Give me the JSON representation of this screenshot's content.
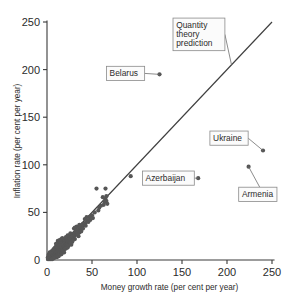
{
  "chart_data": {
    "type": "scatter",
    "title": "",
    "xlabel": "Money growth rate (per cent per year)",
    "ylabel": "Inflation rate (per cent per year)",
    "xlim": [
      0,
      250
    ],
    "ylim": [
      0,
      250
    ],
    "xticks": [
      0,
      50,
      100,
      150,
      200,
      250
    ],
    "yticks": [
      0,
      50,
      100,
      150,
      200,
      250
    ],
    "xtick_labels": [
      "0",
      "50",
      "100",
      "150",
      "200",
      "250"
    ],
    "ytick_labels": [
      "0",
      "50",
      "100",
      "150",
      "200",
      "250"
    ],
    "grid": false,
    "legend": false,
    "reference_line": {
      "name": "Quantity theory prediction",
      "type": "identity",
      "slope": 1,
      "intercept": 0,
      "from": [
        0,
        0
      ],
      "to": [
        250,
        250
      ]
    },
    "annotations": [
      {
        "label": "Belarus",
        "x": 125,
        "y": 195,
        "box_x": 66,
        "box_y": 196
      },
      {
        "label": "Ukraine",
        "x": 240,
        "y": 115,
        "box_x": 181,
        "box_y": 128
      },
      {
        "label": "Armenia",
        "x": 224,
        "y": 98,
        "box_x": 213,
        "box_y": 69
      },
      {
        "label": "Azerbaijan",
        "x": 168,
        "y": 86,
        "box_x": 106,
        "box_y": 86
      },
      {
        "label": "Quantity theory prediction",
        "x": 205,
        "y": 205,
        "box_x": 140,
        "box_y": 237
      }
    ],
    "points": [
      [
        125,
        195
      ],
      [
        240,
        115
      ],
      [
        224,
        98
      ],
      [
        168,
        86
      ],
      [
        93,
        88
      ],
      [
        55,
        75
      ],
      [
        65,
        75
      ],
      [
        65,
        64
      ],
      [
        66,
        62
      ],
      [
        64,
        61
      ],
      [
        67,
        59
      ],
      [
        63,
        58
      ],
      [
        58,
        55
      ],
      [
        53,
        50
      ],
      [
        50,
        47
      ],
      [
        47,
        45
      ],
      [
        45,
        41
      ],
      [
        43,
        39
      ],
      [
        41,
        37
      ],
      [
        40,
        38
      ],
      [
        38,
        34
      ],
      [
        37,
        32
      ],
      [
        36,
        33
      ],
      [
        35,
        30
      ],
      [
        34,
        31
      ],
      [
        33,
        28
      ],
      [
        32,
        27
      ],
      [
        32,
        30
      ],
      [
        31,
        26
      ],
      [
        30,
        25
      ],
      [
        30,
        28
      ],
      [
        29,
        24
      ],
      [
        29,
        27
      ],
      [
        28,
        23
      ],
      [
        28,
        26
      ],
      [
        27,
        22
      ],
      [
        27,
        25
      ],
      [
        26,
        21
      ],
      [
        26,
        24
      ],
      [
        25,
        20
      ],
      [
        25,
        23
      ],
      [
        24,
        19
      ],
      [
        24,
        22
      ],
      [
        23,
        18
      ],
      [
        23,
        21
      ],
      [
        22,
        17
      ],
      [
        22,
        20
      ],
      [
        21,
        16
      ],
      [
        21,
        19
      ],
      [
        20,
        15
      ],
      [
        20,
        18
      ],
      [
        20,
        21
      ],
      [
        19,
        14
      ],
      [
        19,
        17
      ],
      [
        19,
        20
      ],
      [
        18,
        13
      ],
      [
        18,
        16
      ],
      [
        18,
        19
      ],
      [
        17,
        12
      ],
      [
        17,
        15
      ],
      [
        17,
        18
      ],
      [
        16,
        11
      ],
      [
        16,
        14
      ],
      [
        16,
        17
      ],
      [
        15,
        10
      ],
      [
        15,
        13
      ],
      [
        15,
        16
      ],
      [
        14,
        9
      ],
      [
        14,
        12
      ],
      [
        14,
        15
      ],
      [
        13,
        8
      ],
      [
        13,
        11
      ],
      [
        13,
        14
      ],
      [
        12,
        7
      ],
      [
        12,
        10
      ],
      [
        12,
        13
      ],
      [
        11,
        6
      ],
      [
        11,
        9
      ],
      [
        11,
        12
      ],
      [
        10,
        5
      ],
      [
        10,
        8
      ],
      [
        10,
        11
      ],
      [
        9,
        4
      ],
      [
        9,
        7
      ],
      [
        9,
        10
      ],
      [
        8,
        3
      ],
      [
        8,
        6
      ],
      [
        8,
        9
      ],
      [
        7,
        3
      ],
      [
        7,
        5
      ],
      [
        7,
        8
      ],
      [
        6,
        2
      ],
      [
        6,
        4
      ],
      [
        6,
        7
      ],
      [
        5,
        2
      ],
      [
        5,
        4
      ],
      [
        5,
        6
      ],
      [
        4,
        1
      ],
      [
        4,
        3
      ],
      [
        4,
        5
      ],
      [
        3,
        1
      ],
      [
        3,
        3
      ],
      [
        3,
        5
      ],
      [
        2,
        1
      ],
      [
        2,
        2
      ],
      [
        2,
        4
      ],
      [
        1,
        1
      ],
      [
        1,
        2
      ],
      [
        1,
        3
      ],
      [
        21,
        24
      ],
      [
        23,
        26
      ],
      [
        26,
        28
      ],
      [
        30,
        33
      ],
      [
        33,
        35
      ],
      [
        36,
        29
      ],
      [
        39,
        35
      ],
      [
        42,
        43
      ],
      [
        46,
        40
      ],
      [
        35,
        25
      ],
      [
        31,
        22
      ],
      [
        28,
        19
      ],
      [
        25,
        17
      ],
      [
        22,
        14
      ],
      [
        19,
        11
      ],
      [
        17,
        9
      ],
      [
        14,
        7
      ],
      [
        12,
        5
      ],
      [
        9,
        3
      ],
      [
        7,
        2
      ],
      [
        5,
        1
      ],
      [
        16,
        22
      ],
      [
        13,
        18
      ],
      [
        11,
        15
      ],
      [
        9,
        13
      ],
      [
        8,
        12
      ],
      [
        6,
        9
      ],
      [
        4,
        7
      ],
      [
        3,
        6
      ],
      [
        20,
        12
      ],
      [
        24,
        15
      ],
      [
        27,
        16
      ],
      [
        15,
        19
      ],
      [
        12,
        16
      ],
      [
        10,
        14
      ],
      [
        18,
        22
      ],
      [
        19,
        8
      ],
      [
        16,
        6
      ],
      [
        13,
        4
      ],
      [
        11,
        3
      ],
      [
        8,
        2
      ],
      [
        6,
        1
      ],
      [
        31,
        34
      ],
      [
        33,
        31
      ],
      [
        38,
        30
      ],
      [
        40,
        33
      ],
      [
        43,
        36
      ],
      [
        48,
        42
      ],
      [
        51,
        44
      ],
      [
        57,
        52
      ],
      [
        60,
        57
      ],
      [
        62,
        66
      ],
      [
        66,
        67
      ],
      [
        2,
        6
      ],
      [
        3,
        8
      ],
      [
        5,
        9
      ],
      [
        7,
        11
      ],
      [
        10,
        17
      ],
      [
        12,
        20
      ],
      [
        14,
        21
      ],
      [
        17,
        23
      ],
      [
        21,
        12
      ],
      [
        23,
        13
      ],
      [
        26,
        18
      ],
      [
        29,
        21
      ],
      [
        34,
        27
      ],
      [
        36,
        37
      ],
      [
        44,
        45
      ]
    ]
  }
}
